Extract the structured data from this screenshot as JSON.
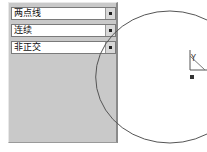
{
  "panel": {
    "dropdowns": [
      {
        "value": "两点线"
      },
      {
        "value": "连续"
      },
      {
        "value": "非正交"
      }
    ]
  },
  "canvas": {
    "ucs_label": "Y",
    "colors": {
      "panel_bg": "#c9c9c9",
      "circle": "#555555"
    }
  }
}
